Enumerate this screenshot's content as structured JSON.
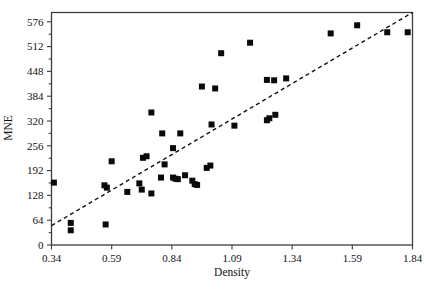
{
  "figure": {
    "background_color": "#ffffff",
    "frame_color": "#3d3d3d",
    "marker_color": "#0a0a0a",
    "trend_color": "#111111"
  },
  "chart_data": {
    "type": "scatter",
    "title": "",
    "xlabel": "Density",
    "ylabel": "MNE",
    "xlim": [
      0.34,
      1.84
    ],
    "ylim": [
      0,
      600
    ],
    "grid": false,
    "legend": null,
    "xticks": [
      0.34,
      0.59,
      0.84,
      1.09,
      1.34,
      1.59,
      1.84
    ],
    "xtick_labels": [
      "0.34",
      "0.59",
      "0.84",
      "1.09",
      "1.34",
      "1.59",
      "1.84"
    ],
    "yticks": [
      0,
      64,
      128,
      192,
      256,
      320,
      384,
      448,
      512,
      576
    ],
    "ytick_labels": [
      "0",
      "64",
      "128",
      "192",
      "256",
      "320",
      "384",
      "448",
      "512",
      "576"
    ],
    "marker": "square",
    "marker_size": 6,
    "points": [
      {
        "x": 0.35,
        "y": 161
      },
      {
        "x": 0.42,
        "y": 57
      },
      {
        "x": 0.42,
        "y": 38
      },
      {
        "x": 0.56,
        "y": 154
      },
      {
        "x": 0.57,
        "y": 148
      },
      {
        "x": 0.565,
        "y": 53
      },
      {
        "x": 0.59,
        "y": 216
      },
      {
        "x": 0.655,
        "y": 137
      },
      {
        "x": 0.705,
        "y": 159
      },
      {
        "x": 0.715,
        "y": 143
      },
      {
        "x": 0.72,
        "y": 225
      },
      {
        "x": 0.735,
        "y": 229
      },
      {
        "x": 0.755,
        "y": 133
      },
      {
        "x": 0.755,
        "y": 342
      },
      {
        "x": 0.795,
        "y": 174
      },
      {
        "x": 0.8,
        "y": 288
      },
      {
        "x": 0.81,
        "y": 208
      },
      {
        "x": 0.845,
        "y": 250
      },
      {
        "x": 0.845,
        "y": 174
      },
      {
        "x": 0.855,
        "y": 171
      },
      {
        "x": 0.865,
        "y": 170
      },
      {
        "x": 0.875,
        "y": 288
      },
      {
        "x": 0.895,
        "y": 180
      },
      {
        "x": 0.925,
        "y": 166
      },
      {
        "x": 0.935,
        "y": 157
      },
      {
        "x": 0.945,
        "y": 155
      },
      {
        "x": 0.965,
        "y": 409
      },
      {
        "x": 0.985,
        "y": 199
      },
      {
        "x": 1.0,
        "y": 205
      },
      {
        "x": 1.005,
        "y": 311
      },
      {
        "x": 1.02,
        "y": 404
      },
      {
        "x": 1.045,
        "y": 495
      },
      {
        "x": 1.1,
        "y": 308
      },
      {
        "x": 1.165,
        "y": 522
      },
      {
        "x": 1.235,
        "y": 426
      },
      {
        "x": 1.235,
        "y": 322
      },
      {
        "x": 1.245,
        "y": 327
      },
      {
        "x": 1.265,
        "y": 425
      },
      {
        "x": 1.27,
        "y": 336
      },
      {
        "x": 1.315,
        "y": 430
      },
      {
        "x": 1.5,
        "y": 546
      },
      {
        "x": 1.61,
        "y": 567
      },
      {
        "x": 1.735,
        "y": 549
      },
      {
        "x": 1.82,
        "y": 549
      }
    ],
    "trend_line": {
      "style": "dashed",
      "x_start": 0.34,
      "y_start": 50,
      "x_end": 1.845,
      "y_end": 600
    }
  }
}
